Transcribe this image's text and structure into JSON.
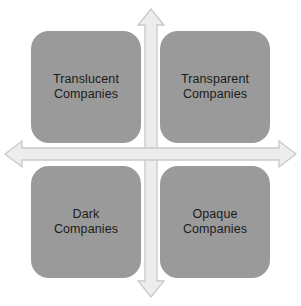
{
  "figure": {
    "type": "two-by-two-matrix",
    "background_color": "#ffffff",
    "box_fill_color": "#9a9a9a",
    "box_text_color": "#1b1b1b",
    "axis_fill_color": "#ededed",
    "axis_stroke_color": "#c9c9c9"
  },
  "axes": {
    "vertical_axis_name": "vertical-double-arrow",
    "horizontal_axis_name": "horizontal-double-arrow"
  },
  "quadrants": [
    {
      "id": "translucent",
      "position": "top-left",
      "label": "Translucent\nCompanies",
      "line1": "Translucent",
      "line2": "Companies"
    },
    {
      "id": "transparent",
      "position": "top-right",
      "label": "Transparent\nCompanies",
      "line1": "Transparent",
      "line2": "Companies"
    },
    {
      "id": "dark",
      "position": "bottom-left",
      "label": "Dark\nCompanies",
      "line1": "Dark",
      "line2": "Companies"
    },
    {
      "id": "opaque",
      "position": "bottom-right",
      "label": "Opaque\nCompanies",
      "line1": "Opaque",
      "line2": "Companies"
    }
  ]
}
